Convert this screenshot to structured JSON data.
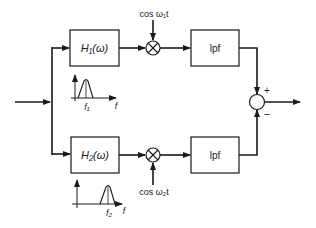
{
  "diagram": {
    "type": "block-diagram",
    "colors": {
      "stroke": "#1a1a1a",
      "background": "#ffffff"
    },
    "input": {
      "label": ""
    },
    "branches": [
      {
        "filter": {
          "label": "H₁(ω)"
        },
        "spectrum": {
          "center_label": "f₁",
          "axis_label": "f"
        },
        "mixer": {
          "symbol": "⊗",
          "carrier_label": "cos ω₁t"
        },
        "lowpass": {
          "label": "lpf"
        },
        "sum_sign": "+"
      },
      {
        "filter": {
          "label": "H₂(ω)"
        },
        "spectrum": {
          "center_label": "f₂",
          "axis_label": "f"
        },
        "mixer": {
          "symbol": "⊗",
          "carrier_label": "cos ω₂t"
        },
        "lowpass": {
          "label": "lpf"
        },
        "sum_sign": "−"
      }
    ],
    "summer": {
      "symbol": "circle"
    },
    "output": {
      "label": ""
    }
  }
}
